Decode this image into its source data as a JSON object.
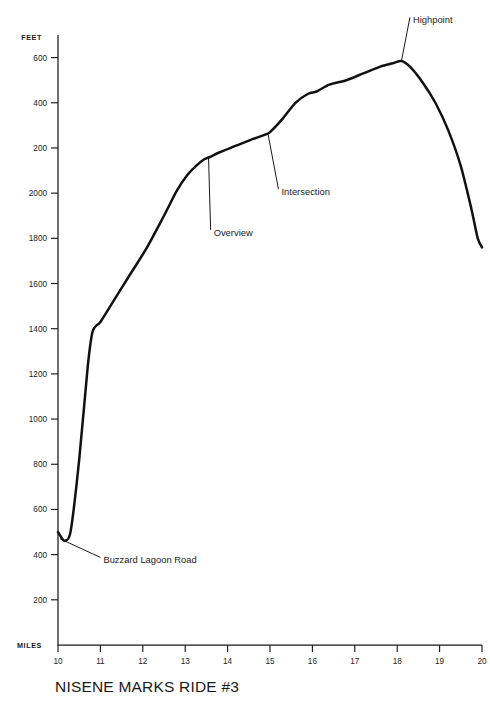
{
  "page": {
    "cropped_header_text": "",
    "title": "NISENE MARKS RIDE #3"
  },
  "axes": {
    "y_axis_name": "FEET",
    "x_axis_name": "MILES"
  },
  "chart_data": {
    "type": "line",
    "title": "NISENE MARKS RIDE #3",
    "xlabel": "MILES",
    "ylabel": "FEET",
    "xlim": [
      10,
      20
    ],
    "ylim": [
      0,
      2700
    ],
    "grid": false,
    "legend": "none",
    "x_ticks": [
      10,
      11,
      12,
      13,
      14,
      15,
      16,
      17,
      18,
      19,
      20
    ],
    "x_tick_labels": [
      "10",
      "11",
      "12",
      "13",
      "14",
      "15",
      "16",
      "17",
      "18",
      "19",
      "20"
    ],
    "y_ticks": [
      200,
      400,
      600,
      800,
      1000,
      1200,
      1400,
      1600,
      1800,
      2000,
      2200,
      2400,
      2600
    ],
    "y_tick_labels": [
      "200",
      "400",
      "600",
      "800",
      "1000",
      "1200",
      "1400",
      "1600",
      "1800",
      "2000",
      "200",
      "400",
      "600"
    ],
    "series": [
      {
        "name": "Elevation profile",
        "color": "#111111",
        "x": [
          10.0,
          10.1,
          10.18,
          10.3,
          10.5,
          10.7,
          10.82,
          11.0,
          11.3,
          11.7,
          12.1,
          12.5,
          12.8,
          13.05,
          13.25,
          13.45,
          13.58,
          13.8,
          14.2,
          14.6,
          14.9,
          15.0,
          15.3,
          15.6,
          15.9,
          16.1,
          16.4,
          16.8,
          17.2,
          17.6,
          17.9,
          18.1,
          18.3,
          18.6,
          18.9,
          19.2,
          19.5,
          19.75,
          19.9,
          20.0
        ],
        "y": [
          500,
          470,
          462,
          505,
          820,
          1230,
          1390,
          1430,
          1520,
          1640,
          1760,
          1900,
          2010,
          2080,
          2120,
          2150,
          2160,
          2180,
          2210,
          2240,
          2260,
          2270,
          2330,
          2400,
          2440,
          2450,
          2480,
          2500,
          2530,
          2560,
          2575,
          2585,
          2560,
          2490,
          2400,
          2280,
          2120,
          1930,
          1800,
          1760
        ]
      }
    ],
    "annotations": [
      {
        "label": "Buzzard Lagoon Road",
        "x": 10.05,
        "y": 470,
        "text_x": 11.0,
        "text_y": 370
      },
      {
        "label": "Overview",
        "x": 13.55,
        "y": 2160,
        "text_x": 13.6,
        "text_y": 1820
      },
      {
        "label": "Intersection",
        "x": 14.95,
        "y": 2265,
        "text_x": 15.2,
        "text_y": 2000
      },
      {
        "label": "Highpoint",
        "x": 18.1,
        "y": 2585,
        "text_x": 18.3,
        "text_y": 2760
      }
    ]
  }
}
